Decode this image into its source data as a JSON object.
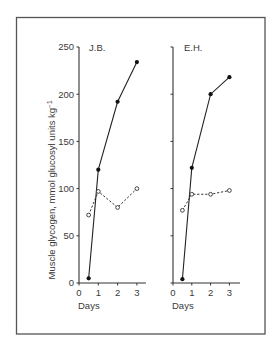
{
  "chart_data": [
    {
      "type": "line",
      "panel_label": "J.B.",
      "x_ticks": [
        0,
        1,
        2,
        3
      ],
      "xlim": [
        0,
        3.5
      ],
      "ylim": [
        0,
        250
      ],
      "y_ticks": [
        0,
        50,
        100,
        150,
        200,
        250
      ],
      "y_tick_labels_visible": true,
      "xlabel": "Days",
      "ylabel": "Muscle glycogen, mmol glucosyl units kg⁻¹",
      "series": [
        {
          "name": "filled",
          "marker": "filled-circle",
          "line": "solid",
          "x": [
            0.5,
            1,
            2,
            3
          ],
          "y": [
            5,
            120,
            192,
            234
          ]
        },
        {
          "name": "open",
          "marker": "open-circle",
          "line": "dashed",
          "x": [
            0.5,
            1,
            2,
            3
          ],
          "y": [
            72,
            97,
            80,
            100
          ]
        }
      ]
    },
    {
      "type": "line",
      "panel_label": "E.H.",
      "x_ticks": [
        0,
        1,
        2,
        3
      ],
      "xlim": [
        0,
        3.5
      ],
      "ylim": [
        0,
        250
      ],
      "y_ticks": [
        0,
        50,
        100,
        150,
        200,
        250
      ],
      "y_tick_labels_visible": false,
      "xlabel": "Days",
      "ylabel": "",
      "series": [
        {
          "name": "filled",
          "marker": "filled-circle",
          "line": "solid",
          "x": [
            0.5,
            1,
            2,
            3
          ],
          "y": [
            4,
            122,
            200,
            218
          ]
        },
        {
          "name": "open",
          "marker": "open-circle",
          "line": "dashed",
          "x": [
            0.5,
            1,
            2,
            3
          ],
          "y": [
            77,
            94,
            94,
            98
          ]
        }
      ]
    }
  ],
  "figure": {
    "ylabel_main": "Muscle glycogen, mmol glucosyl units kg",
    "ylabel_superscript": "−1"
  }
}
